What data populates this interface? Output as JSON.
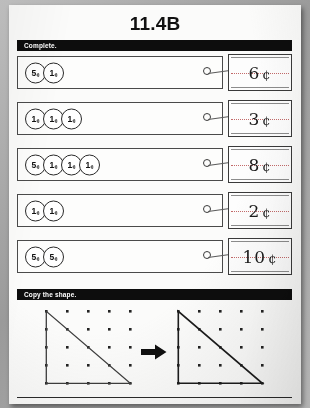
{
  "worksheet": {
    "title": "11.4B",
    "cent_symbol": "¢"
  },
  "sections": {
    "complete": {
      "label": "Complete.",
      "problems": [
        {
          "coins": [
            {
              "value": "5",
              "unit": "¢"
            },
            {
              "value": "1",
              "unit": "¢"
            }
          ],
          "answer_value": "6",
          "answer_unit": "¢"
        },
        {
          "coins": [
            {
              "value": "1",
              "unit": "¢"
            },
            {
              "value": "1",
              "unit": "¢"
            },
            {
              "value": "1",
              "unit": "¢"
            }
          ],
          "answer_value": "3",
          "answer_unit": "¢"
        },
        {
          "coins": [
            {
              "value": "5",
              "unit": "¢"
            },
            {
              "value": "1",
              "unit": "¢"
            },
            {
              "value": "1",
              "unit": "¢"
            },
            {
              "value": "1",
              "unit": "¢"
            }
          ],
          "answer_value": "8",
          "answer_unit": "¢"
        },
        {
          "coins": [
            {
              "value": "1",
              "unit": "¢"
            },
            {
              "value": "1",
              "unit": "¢"
            }
          ],
          "answer_value": "2",
          "answer_unit": "¢"
        },
        {
          "coins": [
            {
              "value": "5",
              "unit": "¢"
            },
            {
              "value": "5",
              "unit": "¢"
            }
          ],
          "answer_value": "10",
          "answer_unit": "¢"
        }
      ]
    },
    "copy_shape": {
      "label": "Copy the shape.",
      "grid": {
        "rows": 5,
        "cols": 5
      },
      "shape": {
        "name": "right-triangle",
        "vertices": [
          [
            0,
            0
          ],
          [
            0,
            4
          ],
          [
            4,
            4
          ]
        ]
      },
      "arrow": "arrow-right-icon"
    }
  },
  "colors": {
    "bar_background": "#0d0d0d",
    "bar_text": "#ffffff",
    "paper": "#fbfbfa",
    "ink": "#111111",
    "rule_guide": "#b03a3a"
  }
}
